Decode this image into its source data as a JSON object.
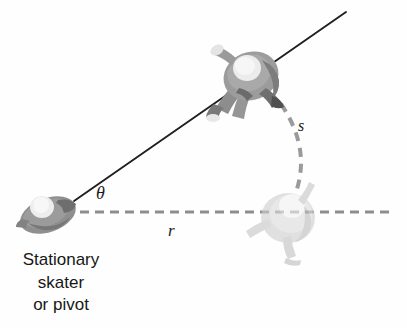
{
  "figure": {
    "background_color": "#fefefe",
    "width": 407,
    "height": 328,
    "labels": {
      "theta": "θ",
      "radius": "r",
      "arc_length": "s"
    },
    "caption": {
      "line1": "Stationary",
      "line2": "skater",
      "line3": "or pivot"
    },
    "colors": {
      "line_solid": "#1f1f1f",
      "line_dashed": "#8d8d8d",
      "arc_dashed": "#9a9a9a",
      "skater_body": "#9c9c9c",
      "skater_body_dark": "#6f6f6f",
      "skater_highlight": "#ececec",
      "skater_faded": "#cfcfcf",
      "pivot_body": "#8f8f8f",
      "text": "#171717"
    },
    "geometry": {
      "pivot": [
        74,
        201
      ],
      "solid_ray_end": [
        346,
        12
      ],
      "dashed_ray_end": [
        389,
        212
      ],
      "arc_start": [
        281,
        104
      ],
      "arc_end": [
        296,
        192
      ],
      "arc_control": [
        309,
        150
      ]
    },
    "elements": {
      "pivot_skater_name": "stationary-skater-figure",
      "rotated_skater_name": "rotated-skater-figure",
      "reference_skater_name": "reference-skater-figure"
    }
  }
}
